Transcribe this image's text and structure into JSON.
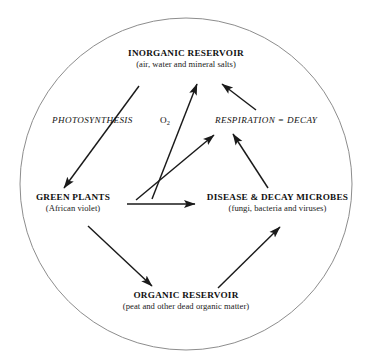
{
  "diagram": {
    "shape": "circle",
    "background_color": "#ffffff",
    "line_color": "#1a1a1a",
    "circle_stroke_color": "#888888",
    "nodes": [
      {
        "id": "inorganic-reservoir",
        "title": "INORGANIC RESERVOIR",
        "subtitle": "(air, water and mineral salts)"
      },
      {
        "id": "green-plants",
        "title": "GREEN PLANTS",
        "subtitle": "(African violet)"
      },
      {
        "id": "disease-decay-microbes",
        "title": "DISEASE & DECAY MICROBES",
        "subtitle": "(fungi, bacteria and viruses)"
      },
      {
        "id": "organic-reservoir",
        "title": "ORGANIC RESERVOIR",
        "subtitle": "(peat and other dead organic matter)"
      }
    ],
    "process_labels": [
      {
        "id": "photosynthesis",
        "text": "PHOTOSYNTHESIS"
      },
      {
        "id": "respiration-decay",
        "text": "RESPIRATION = DECAY"
      }
    ],
    "molecule_labels": [
      {
        "id": "oxygen",
        "text": "O",
        "subscript": "2"
      }
    ],
    "arrows": [
      {
        "id": "inorganic-to-green-plants",
        "label": "PHOTOSYNTHESIS",
        "from": "inorganic-reservoir",
        "to": "green-plants"
      },
      {
        "id": "green-plants-to-inorganic",
        "label": "O2",
        "from": "green-plants",
        "to": "inorganic-reservoir"
      },
      {
        "id": "green-plants-to-respiration",
        "label": "RESPIRATION = DECAY",
        "from": "green-plants",
        "to": "respiration-decay"
      },
      {
        "id": "microbes-to-respiration",
        "label": "RESPIRATION = DECAY",
        "from": "disease-decay-microbes",
        "to": "respiration-decay"
      },
      {
        "id": "respiration-to-inorganic",
        "label": "RESPIRATION = DECAY",
        "from": "respiration-decay",
        "to": "inorganic-reservoir"
      },
      {
        "id": "green-plants-to-microbes",
        "label": "",
        "from": "green-plants",
        "to": "disease-decay-microbes"
      },
      {
        "id": "green-plants-to-organic",
        "label": "",
        "from": "green-plants",
        "to": "organic-reservoir"
      },
      {
        "id": "organic-to-microbes",
        "label": "",
        "from": "organic-reservoir",
        "to": "disease-decay-microbes"
      }
    ]
  }
}
